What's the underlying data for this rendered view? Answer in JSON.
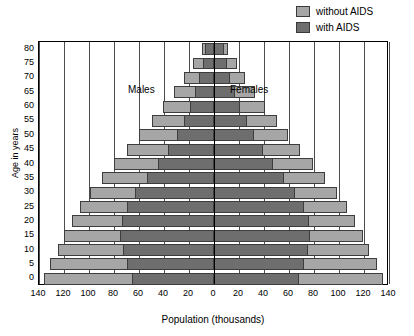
{
  "chart_data": {
    "type": "bar",
    "subtype": "population-pyramid",
    "title": "",
    "xlabel": "Population (thousands)",
    "ylabel": "Age in years",
    "grid": true,
    "legend_position": "top-right",
    "xlim": [
      -140,
      140
    ],
    "xticks": [
      140,
      120,
      100,
      80,
      60,
      40,
      20,
      0,
      20,
      40,
      60,
      80,
      100,
      120,
      140
    ],
    "xtick_values": [
      -140,
      -120,
      -100,
      -80,
      -60,
      -40,
      -20,
      0,
      20,
      40,
      60,
      80,
      100,
      120,
      140
    ],
    "categories": [
      0,
      5,
      10,
      15,
      20,
      25,
      30,
      35,
      40,
      45,
      50,
      55,
      60,
      65,
      70,
      75,
      80
    ],
    "ytick_labels": [
      "0",
      "5",
      "10",
      "15",
      "20",
      "25",
      "30",
      "35",
      "40",
      "45",
      "50",
      "55",
      "60",
      "65",
      "70",
      "75",
      "80"
    ],
    "annotations": [
      {
        "text": "Males",
        "side": "left"
      },
      {
        "text": "Females",
        "side": "right"
      }
    ],
    "series": [
      {
        "name": "without AIDS",
        "color": "#a6a6a6",
        "males": [
          136,
          131,
          125,
          120,
          114,
          107,
          99,
          90,
          80,
          70,
          60,
          50,
          41,
          32,
          24,
          17,
          10
        ],
        "females": [
          135,
          130,
          124,
          119,
          113,
          106,
          98,
          89,
          79,
          69,
          59,
          50,
          41,
          33,
          25,
          18,
          11
        ]
      },
      {
        "name": "with AIDS",
        "color": "#6e6e6e",
        "males": [
          66,
          70,
          73,
          75,
          74,
          70,
          63,
          54,
          45,
          37,
          30,
          24,
          19,
          15,
          12,
          9,
          7
        ],
        "females": [
          68,
          72,
          75,
          77,
          76,
          72,
          65,
          56,
          47,
          39,
          32,
          26,
          21,
          17,
          13,
          10,
          8
        ]
      }
    ]
  },
  "legend": {
    "items": [
      {
        "label": "without AIDS",
        "color": "#a6a6a6"
      },
      {
        "label": "with AIDS",
        "color": "#6e6e6e"
      }
    ]
  }
}
